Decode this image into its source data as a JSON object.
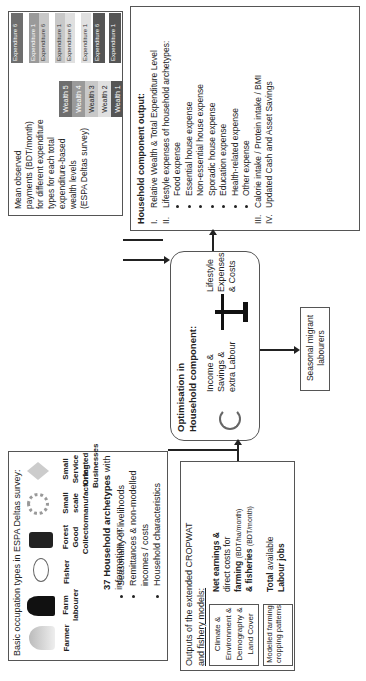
{
  "occupation": {
    "title": "Basic occupation types in ESPA Deltas survey:",
    "types": [
      "Farmer",
      "Farm labourer",
      "Fisher",
      "Forest Good Collector",
      "Small scale manufacturing",
      "Small Service Oriented Businesses"
    ],
    "archetypes_bold": "37 Household archetypes",
    "archetypes_rest": " with information on:",
    "bullets": [
      "Seasonality of livelihoods",
      "Remittances & non-modelled incomes / costs",
      "Household characteristics"
    ]
  },
  "wealth": {
    "desc_lines": [
      "Mean observed",
      "payments (BDT/month)",
      "for different expenditure",
      "types for each total",
      "expenditure-based",
      "wealth levels",
      "(ESPA Deltas survey)"
    ],
    "levels": [
      "Wealth 5",
      "Wealth 4",
      "Wealth 3",
      "Wealth 2",
      "Wealth 1"
    ],
    "expenditures": [
      "Expenditure 6",
      "Expenditure 1",
      "Expenditure 6",
      "Expenditure 1",
      "Expenditure 6",
      "Expenditure 1",
      "Expenditure 6",
      "Expenditure 1"
    ],
    "colors": [
      "#6e6e6e",
      "#9a9a9a",
      "#c8c8c8",
      "#e0e0e0",
      "#555555"
    ]
  },
  "models": {
    "title_l1": "Outputs of the extended CROPWAT",
    "title_l2": "and fishery models:",
    "inputs": [
      "Climate & Environment & Demography & Land Cover",
      "Modelled farming cropping patterns"
    ],
    "out1_bold": "Net earnings &",
    "out1_l2": "direct costs for",
    "out1_l3b": "farming",
    "out1_l3s": "(BDT/ha/month)",
    "out1_l4b": "& fisheries",
    "out1_l4s": "(BDT/month)",
    "out2_l1b": "Total",
    "out2_l1": " available",
    "out2_l2b": "Labour jobs"
  },
  "optimisation": {
    "title_l1": "Optimisation in",
    "title_l2": "Household component:",
    "left": [
      "Income &",
      "Savings &",
      "extra Labour"
    ],
    "right": [
      "Lifestyle",
      "Expenses",
      "& Costs"
    ]
  },
  "migrant": {
    "label_l1": "Seasonal migrant",
    "label_l2": "labourers"
  },
  "output": {
    "title": "Household component  output:",
    "items": [
      {
        "num": "I.",
        "text": "Relative Wealth & Total Expenditure Level"
      },
      {
        "num": "II.",
        "text": "Lifestyle expenses of household archetypes:"
      }
    ],
    "sub": [
      "Food expense",
      "Essential house expense",
      "Non-essential house expense",
      "Sporadic house expense",
      "Education expense",
      "Health-related expense",
      "Other expense"
    ],
    "items2": [
      {
        "num": "III.",
        "text": "Calorie intake / Protein intake / BMI"
      },
      {
        "num": "IV.",
        "text": "Updated Cash and Asset Savings"
      }
    ]
  }
}
